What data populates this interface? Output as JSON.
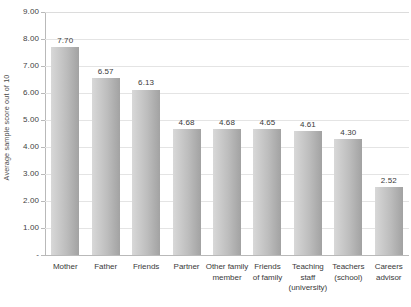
{
  "chart_data": {
    "type": "bar",
    "title": "",
    "xlabel": "",
    "ylabel": "Average sample score out of 10",
    "ylim": [
      0,
      9
    ],
    "ytick_labels": [
      "9.00",
      "8.00",
      "7.00",
      "6.00",
      "5.00",
      "4.00",
      "3.00",
      "2.00",
      "1.00",
      "-"
    ],
    "ytick_values": [
      9,
      8,
      7,
      6,
      5,
      4,
      3,
      2,
      1,
      0
    ],
    "grid": true,
    "legend": "none",
    "categories": [
      "Mother",
      "Father",
      "Friends",
      "Partner",
      "Other family member",
      "Friends of family",
      "Teaching staff (university)",
      "Teachers (school)",
      "Careers advisor"
    ],
    "category_lines": [
      [
        "Mother"
      ],
      [
        "Father"
      ],
      [
        "Friends"
      ],
      [
        "Partner"
      ],
      [
        "Other family",
        "member"
      ],
      [
        "Friends",
        "of family"
      ],
      [
        "Teaching staff",
        "(university)"
      ],
      [
        "Teachers",
        "(school)"
      ],
      [
        "Careers",
        "advisor"
      ]
    ],
    "values": [
      7.7,
      6.57,
      6.13,
      4.68,
      4.68,
      4.65,
      4.61,
      4.3,
      2.52
    ],
    "value_labels": [
      "7.70",
      "6.57",
      "6.13",
      "4.68",
      "4.68",
      "4.65",
      "4.61",
      "4.30",
      "2.52"
    ],
    "bar_color_light": "#d8d8d8",
    "bar_color_dark": "#a2a2a2",
    "gridline_color": "#e4e4e4",
    "axis_color": "#b9b9b9",
    "text_color": "#3a3a3a",
    "background_color": "#ffffff"
  }
}
